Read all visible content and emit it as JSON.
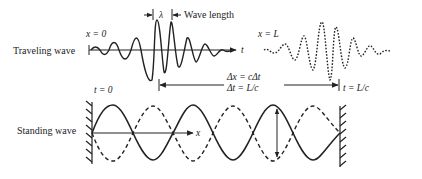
{
  "diagram": {
    "type": "physics-wave-illustration",
    "colors": {
      "ink": "#222222",
      "background": "#ffffff"
    },
    "traveling_wave": {
      "row_label": "Traveling wave",
      "start_label": "x = 0",
      "end_label": "x = L",
      "wavelength_symbol": "λ",
      "wavelength_label": "Wave length",
      "axis_label": "t",
      "start_time_label": "t = 0",
      "end_time_label": "t = L/c",
      "delta_x_label": "Δx = cΔt",
      "delta_t_label": "Δt = L/c"
    },
    "standing_wave": {
      "row_label": "Standing wave",
      "axis_label": "x"
    }
  }
}
